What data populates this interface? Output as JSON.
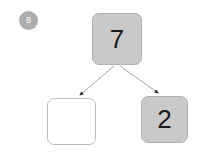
{
  "diagram": {
    "type": "binary-tree",
    "background_color": "#ffffff",
    "step_badge": {
      "label": "8",
      "background_color": "#adadad",
      "text_color": "#ffffff"
    },
    "nodes": [
      {
        "id": "root",
        "value": "7",
        "state": "filled",
        "fill_color": "#c9c9c9",
        "border_color": "#b2b2b2",
        "text_color": "#1a1a1a"
      },
      {
        "id": "left-child",
        "value": "",
        "state": "empty",
        "fill_color": "#ffffff",
        "border_color": "#bdbdbd",
        "text_color": "#1a1a1a"
      },
      {
        "id": "right-child",
        "value": "2",
        "state": "filled",
        "fill_color": "#c9c9c9",
        "border_color": "#b2b2b2",
        "text_color": "#1a1a1a"
      }
    ],
    "edges": [
      {
        "from": "root",
        "to": "left-child",
        "style": "arrow",
        "color": "#9a9a9a"
      },
      {
        "from": "root",
        "to": "right-child",
        "style": "arrow",
        "color": "#9a9a9a"
      }
    ]
  }
}
